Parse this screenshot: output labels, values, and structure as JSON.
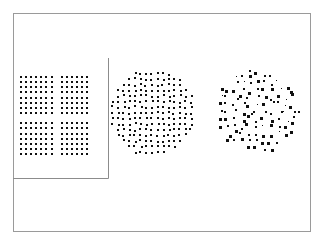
{
  "figure": {
    "background_color": "#ffffff",
    "dot_color": "#101010",
    "frame_color": "#9a9a9a",
    "width": 324,
    "height": 240
  },
  "outer_frame": {
    "name": "outer-frame",
    "x": 13,
    "y": 13,
    "width": 297,
    "height": 218,
    "stroke_width": 1.0,
    "color": "#9a9a9a"
  },
  "inner_frame": {
    "name": "inner-frame",
    "x": 13,
    "y": 58,
    "width": 95,
    "height": 120,
    "stroke_width": 1.0,
    "color": "#8c8c8c",
    "edges": [
      "right",
      "bottom"
    ],
    "note": "open at top and left; left edge coincides with outer frame"
  },
  "chart_data": {
    "type": "scatter",
    "title": "",
    "xlabel": "",
    "ylabel": "",
    "grid": false,
    "legend": null,
    "panels": [
      {
        "id": "panel-ordered-lattice",
        "label": "ordered square lattice",
        "arrangement": "square-lattice",
        "shape": "square",
        "center": [
          55.5,
          115.5
        ],
        "bounds": {
          "x": 21,
          "y": 77,
          "width": 69,
          "height": 77
        },
        "spacing_x": 5.1,
        "spacing_y": 5.15,
        "cols": 14,
        "rows": 16,
        "dot_size": 2.1,
        "jitter": 0.0,
        "size_jitter": 0.0,
        "gap": {
          "type": "cross",
          "skip_col": 7,
          "skip_row": 8,
          "note": "one full column and one full row removed forming a cross-shaped void"
        },
        "count": 195
      },
      {
        "id": "panel-jittered-disk",
        "label": "slightly disordered disk",
        "arrangement": "jittered-lattice-disk",
        "shape": "disk",
        "center": [
          152.0,
          113.0
        ],
        "radius": 43.0,
        "bounds": {
          "x": 112,
          "y": 69,
          "width": 82,
          "height": 90
        },
        "spacing_x": 5.6,
        "spacing_y": 5.6,
        "dot_size": 2.1,
        "jitter": 0.95,
        "size_jitter": 0.35,
        "seed": 1748,
        "count": 205
      },
      {
        "id": "panel-random-disk",
        "label": "strongly disordered disk",
        "arrangement": "random-disk",
        "shape": "disk",
        "center": [
          257.0,
          112.0
        ],
        "radius": 42.0,
        "bounds": {
          "x": 218,
          "y": 68,
          "width": 80,
          "height": 90
        },
        "spacing_x": 7.3,
        "spacing_y": 7.3,
        "dot_size": 2.4,
        "jitter": 2.9,
        "size_jitter": 1.1,
        "seed": 20713,
        "count": 140
      }
    ]
  }
}
